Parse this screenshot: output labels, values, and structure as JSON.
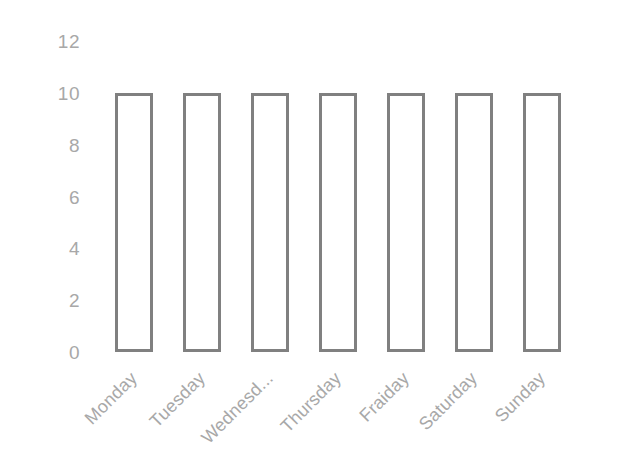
{
  "chart_data": {
    "type": "bar",
    "title": "",
    "subtitle": "",
    "xlabel": "",
    "ylabel": "",
    "categories": [
      "Monday",
      "Tuesday",
      "Wednesd...",
      "Thursday",
      "Fraiday",
      "Saturday",
      "Sunday"
    ],
    "values": [
      10,
      10,
      10,
      10,
      10,
      10,
      10
    ],
    "series": [
      {
        "name": "",
        "values": [
          10,
          10,
          10,
          10,
          10,
          10,
          10
        ]
      }
    ],
    "ylim": [
      0,
      12
    ],
    "y_ticks": [
      0,
      2,
      4,
      6,
      8,
      10,
      12
    ],
    "y_tick_labels": [
      "0",
      "2",
      "4",
      "6",
      "8",
      "10",
      "12"
    ],
    "grid": false,
    "legend": false,
    "legend_position": "none",
    "bar_style": {
      "fill": "#ffffff",
      "stroke": "#808080",
      "stroke_width": 3
    },
    "tick_label_color": "#a8a8a8",
    "x_tick_label_rotation": -45,
    "background_color": "#ffffff"
  }
}
